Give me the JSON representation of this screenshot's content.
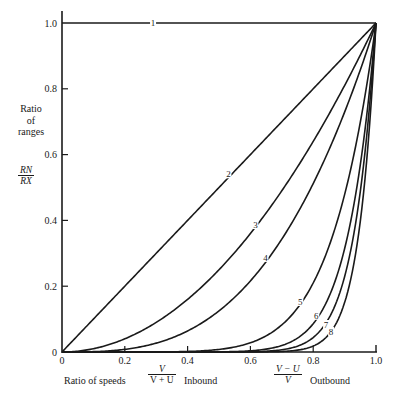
{
  "chart_data": {
    "type": "line",
    "title": "",
    "xlabel": "Ratio of speeds",
    "xlabel_inbound": {
      "numerator": "V",
      "denominator": "V + U",
      "suffix": "Inbound"
    },
    "xlabel_outbound": {
      "numerator": "V − U",
      "denominator": "V",
      "suffix": "Outbound"
    },
    "ylabel": "Ratio of ranges",
    "ylabel_lines": [
      "Ratio",
      "of",
      "ranges"
    ],
    "ylabel_fraction": {
      "numerator": "RN",
      "denominator": "RX"
    },
    "xlim": [
      0,
      1.0
    ],
    "ylim": [
      0,
      1.0
    ],
    "x_ticks": [
      "0",
      "0.2",
      "0.4",
      "0.6",
      "0.8",
      "1.0"
    ],
    "y_ticks": [
      "0",
      "0.2",
      "0.4",
      "0.6",
      "0.8",
      "1.0"
    ],
    "grid": false,
    "legend": "none (curves labeled inline 1–8)",
    "series": [
      {
        "name": "1",
        "x": [
          0,
          0.3,
          1.0
        ],
        "y": [
          1.0,
          1.0,
          1.0
        ]
      },
      {
        "name": "2",
        "x": [
          0,
          0.53,
          0.7,
          1.0
        ],
        "y": [
          0,
          0.54,
          0.705,
          1.0
        ]
      },
      {
        "name": "3",
        "x": [
          0,
          0.2,
          0.35,
          0.616,
          0.84,
          1.0
        ],
        "y": [
          0,
          0.033,
          0.128,
          0.386,
          0.705,
          1.0
        ]
      },
      {
        "name": "4",
        "x": [
          0,
          0.4,
          0.5,
          0.648,
          0.88,
          1.0
        ],
        "y": [
          0,
          0.036,
          0.128,
          0.286,
          0.705,
          1.0
        ]
      },
      {
        "name": "5",
        "x": [
          0,
          0.6,
          0.759,
          0.835,
          0.95,
          1.0
        ],
        "y": [
          0,
          0.03,
          0.152,
          0.28,
          0.705,
          1.0
        ]
      },
      {
        "name": "6",
        "x": [
          0,
          0.7,
          0.8,
          0.889,
          0.96,
          1.0
        ],
        "y": [
          0,
          0.02,
          0.09,
          0.28,
          0.705,
          1.0
        ]
      },
      {
        "name": "7",
        "x": [
          0,
          0.72,
          0.83,
          0.911,
          0.965,
          1.0
        ],
        "y": [
          0,
          0.01,
          0.07,
          0.28,
          0.705,
          1.0
        ]
      },
      {
        "name": "8",
        "x": [
          0,
          0.74,
          0.85,
          0.93,
          0.97,
          1.0
        ],
        "y": [
          0,
          0.005,
          0.06,
          0.28,
          0.705,
          1.0
        ]
      }
    ],
    "approx_model": "y ≈ x^k with k ≈ 0, 1, 2, 3, 7, 11, 14, 18 for curves 1–8",
    "exponents": [
      0,
      1,
      2,
      3,
      7,
      11,
      14,
      18
    ],
    "label_positions": [
      {
        "name": "1",
        "x": 0.29,
        "y": 1.0
      },
      {
        "name": "2",
        "x": 0.53,
        "y": 0.54
      },
      {
        "name": "3",
        "x": 0.616,
        "y": 0.386
      },
      {
        "name": "4",
        "x": 0.648,
        "y": 0.286
      },
      {
        "name": "5",
        "x": 0.759,
        "y": 0.152
      },
      {
        "name": "6",
        "x": 0.81,
        "y": 0.11
      },
      {
        "name": "7",
        "x": 0.841,
        "y": 0.082
      },
      {
        "name": "8",
        "x": 0.857,
        "y": 0.061
      }
    ]
  },
  "colors": {
    "ink": "#1a1a1a",
    "background": "#ffffff"
  }
}
